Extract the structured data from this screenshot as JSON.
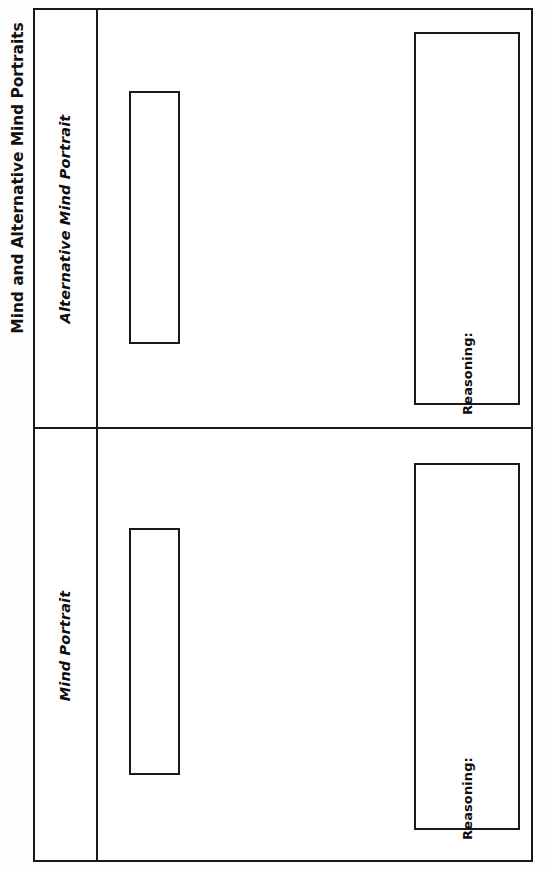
{
  "document": {
    "type": "worksheet",
    "orientation": "landscape-rotated",
    "title": "Mind and Alternative Mind Portraits",
    "background_color": "#fefefe",
    "ink_color": "#1a1a1a"
  },
  "table": {
    "columns": [
      "Section Label",
      "Response Area"
    ],
    "rows": [
      {
        "id": "alternative-mind-portrait",
        "header": "Alternative Mind Portrait",
        "fields": [
          {
            "id": "portrait-area",
            "label": "",
            "value": "",
            "kind": "blank-box"
          },
          {
            "id": "reasoning-area",
            "label": "Reasoning:",
            "value": "",
            "kind": "blank-box"
          }
        ]
      },
      {
        "id": "mind-portrait",
        "header": "Mind Portrait",
        "fields": [
          {
            "id": "portrait-area",
            "label": "",
            "value": "",
            "kind": "blank-box"
          },
          {
            "id": "reasoning-area",
            "label": "Reasoning:",
            "value": "",
            "kind": "blank-box"
          }
        ]
      }
    ]
  }
}
